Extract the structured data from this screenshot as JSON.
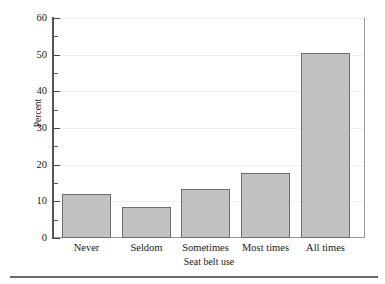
{
  "chart_data": {
    "type": "bar",
    "title": "",
    "subtitle": "",
    "xlabel": "Seat belt use",
    "ylabel": "Percent",
    "categories": [
      "Never",
      "Seldom",
      "Sometimes",
      "Most times",
      "All times"
    ],
    "values": [
      12,
      8.5,
      13.4,
      17.7,
      50.4
    ],
    "series": [
      {
        "name": "Percent",
        "values": [
          12,
          8.5,
          13.4,
          17.7,
          50.4
        ]
      }
    ],
    "ylim": [
      0,
      60
    ],
    "y_major_ticks": [
      0,
      10,
      20,
      30,
      40,
      50,
      60
    ],
    "y_minor_ticks": [
      5,
      15,
      25,
      35,
      45,
      55
    ],
    "y_tick_labels": [
      "0",
      "10",
      "20",
      "30",
      "40",
      "50",
      "60"
    ],
    "grid": true,
    "grid_axis": "y",
    "legend": false,
    "legend_position": "none",
    "annotations": [],
    "colors": {
      "bar_fill": "#c2c2c2",
      "bar_edge": "#6d6d6d",
      "axis": "#555555",
      "frame": "#9a9a9a",
      "grid": "#efefef",
      "text": "#1a1a1a",
      "rule": "#6b6b6b",
      "background": "#ffffff"
    }
  },
  "figure": {
    "bottom_rule": true
  }
}
